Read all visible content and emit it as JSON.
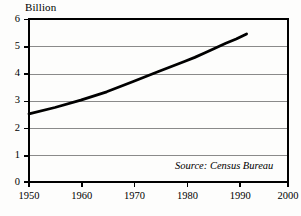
{
  "chart_data": {
    "type": "line",
    "title": "",
    "subtitle": "",
    "unit_label": "Billion",
    "xlabel": "",
    "ylabel": "",
    "xlim": [
      1950,
      2000
    ],
    "ylim": [
      0,
      6
    ],
    "grid": true,
    "grid_axis": "y",
    "legend_position": "none",
    "x_ticks": [
      1950,
      1960,
      1970,
      1980,
      1990,
      2000
    ],
    "x_tick_labels": [
      "1950",
      "1960",
      "1970",
      "1980",
      "1990",
      "2000"
    ],
    "y_ticks": [
      0,
      1,
      2,
      3,
      4,
      5,
      6
    ],
    "y_tick_labels": [
      "0",
      "1",
      "2",
      "3",
      "4",
      "5",
      "6"
    ],
    "annotation": "Source: Census Bureau",
    "series": [
      {
        "name": "World population",
        "color": "#000000",
        "x": [
          1950,
          1955,
          1960,
          1965,
          1970,
          1975,
          1980,
          1982,
          1984,
          1986,
          1988,
          1990,
          1992
        ],
        "values": [
          2.52,
          2.75,
          3.02,
          3.33,
          3.7,
          4.08,
          4.45,
          4.6,
          4.77,
          4.95,
          5.12,
          5.28,
          5.47
        ]
      }
    ]
  },
  "axis": {
    "unit": "Billion",
    "y_labels": [
      "6",
      "5",
      "4",
      "3",
      "2",
      "1",
      "0"
    ],
    "x_labels": [
      "1950",
      "1960",
      "1970",
      "1980",
      "1990",
      "2000"
    ]
  },
  "note": {
    "source": "Source: Census Bureau"
  },
  "colors": {
    "line": "#000000",
    "frame": "#000000",
    "grid": "#8a8a8a",
    "background": "#fdfdfc",
    "text": "#000000"
  }
}
